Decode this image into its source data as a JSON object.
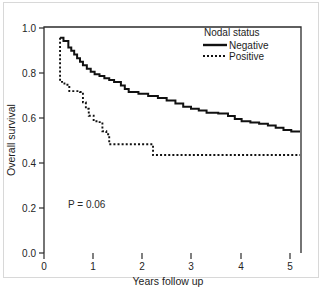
{
  "chart_data": {
    "type": "line",
    "chart_kind": "kaplan-meier-survival",
    "title": "",
    "xlabel": "Years follow up",
    "ylabel": "Overall survival",
    "xlim": [
      0,
      5.28
    ],
    "ylim": [
      0.0,
      1.05
    ],
    "xticks": [
      0,
      1,
      2,
      3,
      4,
      5
    ],
    "xtick_labels": [
      "0",
      "1",
      "2",
      "3",
      "4",
      "5"
    ],
    "yticks": [
      0.0,
      0.2,
      0.4,
      0.6,
      0.8,
      1.0
    ],
    "ytick_labels": [
      "0.0",
      "0.2",
      "0.4",
      "0.6",
      "0.8",
      "1.0"
    ],
    "grid": false,
    "legend_position": "top-right",
    "legend_title": "Nodal status",
    "annotations": [
      {
        "name": "p-value",
        "text": "P = 0.06",
        "x": 0.72,
        "y": 0.205
      }
    ],
    "series": [
      {
        "name": "Negative",
        "style": "solid",
        "color": "#111111",
        "points": [
          [
            0.33,
            1.0
          ],
          [
            0.4,
            1.0
          ],
          [
            0.4,
            0.985
          ],
          [
            0.5,
            0.985
          ],
          [
            0.5,
            0.955
          ],
          [
            0.56,
            0.955
          ],
          [
            0.56,
            0.94
          ],
          [
            0.62,
            0.94
          ],
          [
            0.62,
            0.922
          ],
          [
            0.68,
            0.922
          ],
          [
            0.68,
            0.905
          ],
          [
            0.74,
            0.905
          ],
          [
            0.74,
            0.888
          ],
          [
            0.8,
            0.888
          ],
          [
            0.8,
            0.872
          ],
          [
            0.88,
            0.872
          ],
          [
            0.88,
            0.856
          ],
          [
            0.96,
            0.856
          ],
          [
            0.96,
            0.842
          ],
          [
            1.04,
            0.842
          ],
          [
            1.04,
            0.83
          ],
          [
            1.14,
            0.83
          ],
          [
            1.14,
            0.822
          ],
          [
            1.24,
            0.822
          ],
          [
            1.24,
            0.812
          ],
          [
            1.34,
            0.812
          ],
          [
            1.34,
            0.804
          ],
          [
            1.44,
            0.804
          ],
          [
            1.44,
            0.795
          ],
          [
            1.58,
            0.795
          ],
          [
            1.58,
            0.778
          ],
          [
            1.66,
            0.778
          ],
          [
            1.66,
            0.762
          ],
          [
            1.74,
            0.762
          ],
          [
            1.74,
            0.748
          ],
          [
            1.94,
            0.748
          ],
          [
            1.94,
            0.74
          ],
          [
            2.14,
            0.74
          ],
          [
            2.14,
            0.73
          ],
          [
            2.34,
            0.73
          ],
          [
            2.34,
            0.72
          ],
          [
            2.52,
            0.72
          ],
          [
            2.52,
            0.708
          ],
          [
            2.7,
            0.708
          ],
          [
            2.7,
            0.694
          ],
          [
            2.86,
            0.694
          ],
          [
            2.86,
            0.68
          ],
          [
            3.02,
            0.68
          ],
          [
            3.02,
            0.67
          ],
          [
            3.18,
            0.67
          ],
          [
            3.18,
            0.662
          ],
          [
            3.34,
            0.662
          ],
          [
            3.34,
            0.652
          ],
          [
            3.58,
            0.652
          ],
          [
            3.58,
            0.648
          ],
          [
            3.78,
            0.648
          ],
          [
            3.78,
            0.636
          ],
          [
            3.92,
            0.636
          ],
          [
            3.92,
            0.622
          ],
          [
            4.06,
            0.622
          ],
          [
            4.06,
            0.612
          ],
          [
            4.24,
            0.612
          ],
          [
            4.24,
            0.606
          ],
          [
            4.42,
            0.606
          ],
          [
            4.42,
            0.6
          ],
          [
            4.6,
            0.6
          ],
          [
            4.6,
            0.592
          ],
          [
            4.76,
            0.592
          ],
          [
            4.76,
            0.582
          ],
          [
            4.92,
            0.582
          ],
          [
            4.92,
            0.572
          ],
          [
            5.08,
            0.572
          ],
          [
            5.08,
            0.565
          ],
          [
            5.26,
            0.565
          ]
        ]
      },
      {
        "name": "Positive",
        "style": "dotted",
        "color": "#111111",
        "points": [
          [
            0.33,
            1.0
          ],
          [
            0.33,
            0.795
          ],
          [
            0.42,
            0.795
          ],
          [
            0.42,
            0.782
          ],
          [
            0.52,
            0.782
          ],
          [
            0.52,
            0.752
          ],
          [
            0.74,
            0.752
          ],
          [
            0.74,
            0.748
          ],
          [
            0.8,
            0.748
          ],
          [
            0.8,
            0.7
          ],
          [
            0.86,
            0.7
          ],
          [
            0.86,
            0.67
          ],
          [
            0.92,
            0.67
          ],
          [
            0.92,
            0.638
          ],
          [
            1.02,
            0.638
          ],
          [
            1.02,
            0.612
          ],
          [
            1.1,
            0.612
          ],
          [
            1.1,
            0.608
          ],
          [
            1.2,
            0.608
          ],
          [
            1.2,
            0.566
          ],
          [
            1.28,
            0.566
          ],
          [
            1.28,
            0.552
          ],
          [
            1.34,
            0.552
          ],
          [
            1.34,
            0.505
          ],
          [
            2.24,
            0.505
          ],
          [
            2.24,
            0.455
          ],
          [
            5.26,
            0.455
          ]
        ]
      }
    ]
  },
  "legend": {
    "title": "Nodal status",
    "entries": [
      {
        "label": "Negative",
        "style": "solid"
      },
      {
        "label": "Positive",
        "style": "dotted"
      }
    ]
  },
  "axes": {
    "x_title": "Years follow up",
    "y_title": "Overall survival"
  },
  "annotation": {
    "p_value": "P = 0.06"
  },
  "colors": {
    "curve": "#111111",
    "axis": "#2b2b2b",
    "frame": "#d8d8d8",
    "background": "#ffffff"
  }
}
